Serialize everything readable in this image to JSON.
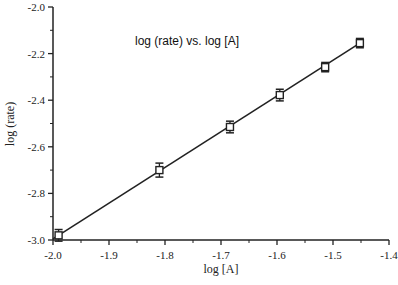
{
  "chart_data": {
    "type": "scatter",
    "title": "log (rate) vs. log [A]",
    "xlabel": "log [A]",
    "ylabel": "log (rate)",
    "xlim": [
      -2.0,
      -1.4
    ],
    "ylim": [
      -3.0,
      -2.0
    ],
    "x_ticks": [
      "-2.0",
      "-1.9",
      "-1.8",
      "-1.7",
      "-1.6",
      "-1.5",
      "-1.4"
    ],
    "y_ticks": [
      "-2.0",
      "-2.2",
      "-2.4",
      "-2.6",
      "-2.8",
      "-3.0"
    ],
    "grid": false,
    "legend": null,
    "series": [
      {
        "name": "data",
        "marker": "open-square",
        "x": [
          -1.99,
          -1.81,
          -1.684,
          -1.595,
          -1.514,
          -1.452
        ],
        "y": [
          -2.98,
          -2.7,
          -2.515,
          -2.378,
          -2.258,
          -2.155
        ],
        "yerr": [
          0.025,
          0.03,
          0.025,
          0.025,
          0.02,
          0.02
        ]
      }
    ],
    "fit_line": {
      "x": [
        -2.0,
        -1.452
      ],
      "y": [
        -2.995,
        -2.155
      ]
    }
  }
}
